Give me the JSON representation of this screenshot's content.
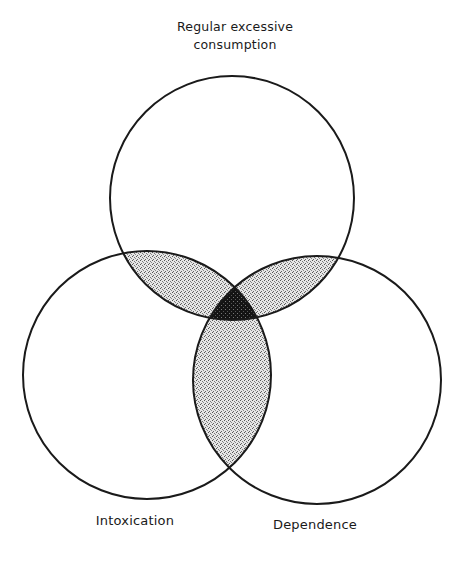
{
  "diagram": {
    "type": "venn",
    "sets": [
      {
        "id": "regular",
        "label_lines": [
          "Regular excessive",
          "consumption"
        ],
        "position": "top"
      },
      {
        "id": "intoxication",
        "label_lines": [
          "Intoxication"
        ],
        "position": "bottom-left"
      },
      {
        "id": "dependence",
        "label_lines": [
          "Dependence"
        ],
        "position": "bottom-right"
      }
    ],
    "labels": {
      "top_line1": "Regular excessive",
      "top_line2": "consumption",
      "left": "Intoxication",
      "right": "Dependence"
    },
    "shading": {
      "pairwise_overlaps": "light stipple",
      "triple_overlap": "dark stipple",
      "pair_fill": "#bdbdbd",
      "triple_fill": "#1c1c1c",
      "stroke": "#1a1a1a"
    }
  }
}
